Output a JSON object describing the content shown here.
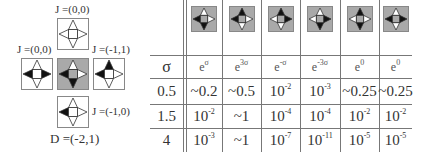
{
  "diagram": {
    "tiles": [
      {
        "id": "top",
        "label": "J =(0,0)",
        "bg": "white",
        "triangles": {
          "up": "white",
          "right": "white",
          "down": "white",
          "left": "white"
        }
      },
      {
        "id": "left",
        "label": "J =(0,0)",
        "bg": "white",
        "triangles": {
          "up": "white",
          "right": "black",
          "down": "white",
          "left": "black"
        }
      },
      {
        "id": "center",
        "label": "",
        "bg": "gray",
        "triangles": {
          "up": "white",
          "right": "white",
          "down": "black",
          "left": "black"
        }
      },
      {
        "id": "right",
        "label": "J =(-1,1)",
        "bg": "white",
        "triangles": {
          "up": "black",
          "right": "white",
          "down": "white",
          "left": "black"
        }
      },
      {
        "id": "bottom",
        "label": "J =(-1,0)",
        "bg": "white",
        "triangles": {
          "up": "white",
          "right": "white",
          "down": "white",
          "left": "black"
        }
      }
    ],
    "bottom_label": "D =(-2,1)"
  },
  "table": {
    "row_header": "σ",
    "columns": [
      {
        "icon": {
          "up": "white",
          "right": "white",
          "down": "black",
          "left": "black"
        },
        "base": "e",
        "exp": "σ"
      },
      {
        "icon": {
          "up": "black",
          "right": "white",
          "down": "white",
          "left": "black"
        },
        "base": "e",
        "exp": "3σ"
      },
      {
        "icon": {
          "up": "black",
          "right": "black",
          "down": "white",
          "left": "white"
        },
        "base": "e",
        "exp": "-σ"
      },
      {
        "icon": {
          "up": "white",
          "right": "black",
          "down": "black",
          "left": "white"
        },
        "base": "e",
        "exp": "-3σ"
      },
      {
        "icon": {
          "up": "black",
          "right": "white",
          "down": "black",
          "left": "white"
        },
        "base": "e",
        "exp": "0"
      },
      {
        "icon": {
          "up": "white",
          "right": "black",
          "down": "white",
          "left": "black"
        },
        "base": "e",
        "exp": "0"
      }
    ],
    "rows": [
      {
        "sigma": "0.5",
        "cells": [
          {
            "text": "~0.2",
            "exp": ""
          },
          {
            "text": "~0.5",
            "exp": ""
          },
          {
            "text": "10",
            "exp": "-2"
          },
          {
            "text": "10",
            "exp": "-3"
          },
          {
            "text": "~0.25",
            "exp": ""
          },
          {
            "text": "~0.25",
            "exp": ""
          }
        ]
      },
      {
        "sigma": "1.5",
        "cells": [
          {
            "text": "10",
            "exp": "-2"
          },
          {
            "text": "~1",
            "exp": ""
          },
          {
            "text": "10",
            "exp": "-4"
          },
          {
            "text": "10",
            "exp": "-4"
          },
          {
            "text": "10",
            "exp": "-2"
          },
          {
            "text": "10",
            "exp": "-2"
          }
        ]
      },
      {
        "sigma": "4",
        "cells": [
          {
            "text": "10",
            "exp": "-3"
          },
          {
            "text": "~1",
            "exp": ""
          },
          {
            "text": "10",
            "exp": "-7"
          },
          {
            "text": "10",
            "exp": "-11"
          },
          {
            "text": "10",
            "exp": "-5"
          },
          {
            "text": "10",
            "exp": "-5"
          }
        ]
      }
    ]
  },
  "colors": {
    "gray": "#a9a9a9",
    "black": "#111111",
    "white": "#ffffff",
    "line": "#777777",
    "tile_border": "#888888"
  }
}
